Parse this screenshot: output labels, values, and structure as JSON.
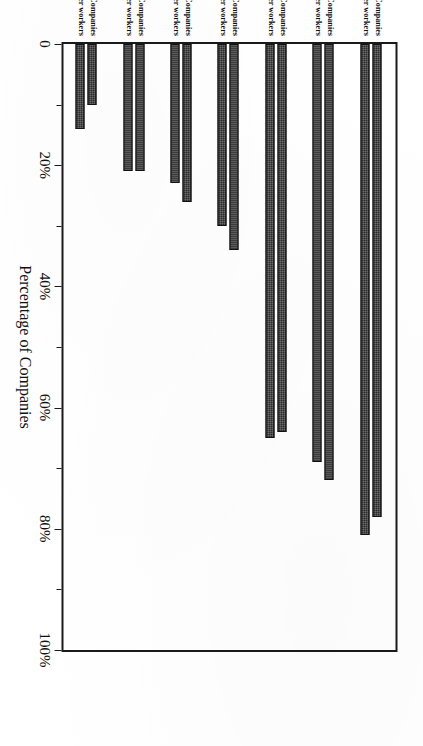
{
  "chart_data": {
    "type": "bar",
    "orientation": "horizontal",
    "title": "",
    "xlabel": "Percentage of Companies",
    "ylabel": "",
    "xlim": [
      0,
      100
    ],
    "grid": false,
    "legend_position": "none",
    "tick_labels": [
      "0",
      "20%",
      "40%",
      "60%",
      "80%",
      "100%"
    ],
    "tick_values": [
      0,
      20,
      40,
      60,
      80,
      100
    ],
    "minor_tick_values": [
      10,
      30,
      50,
      70,
      90
    ],
    "series": [
      {
        "name": "All Companies",
        "values": [
          78,
          72,
          64,
          34,
          26,
          21,
          10
        ]
      },
      {
        "name": "Companies with > 30% older workers",
        "values": [
          81,
          69,
          65,
          30,
          23,
          21,
          14
        ]
      }
    ],
    "categories": [
      "Encouraging training and/or education to\nmaintain or upgrade skills",
      "Hiring retired employees back as consultants or\nseasonal employees",
      "Providing workers over age 55 with preretirement\ncareer and employment counseling",
      "Providing opportunities for workers over age 55\nto transfer to jobs with reduced pay and responsibilities",
      "Establishing alternative career tracks",
      "Providing a program of phased retirement",
      "Making special efforts to hire workers\nover age 55"
    ],
    "bar_color": "#2b2b2b",
    "frame_color": "#1a1a1a"
  },
  "axis": {
    "title": "Percentage of Companies"
  }
}
